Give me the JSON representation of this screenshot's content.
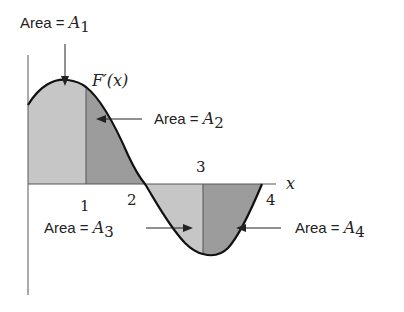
{
  "diagram": {
    "curve_label": "F′(x)",
    "axis_label_x": "x",
    "ticks": [
      "1",
      "2",
      "3",
      "4"
    ],
    "areas": [
      {
        "id": "A1",
        "prefix": "Area = ",
        "symbol": "A",
        "sub": "1"
      },
      {
        "id": "A2",
        "prefix": "Area = ",
        "symbol": "A",
        "sub": "2"
      },
      {
        "id": "A3",
        "prefix": "Area = ",
        "symbol": "A",
        "sub": "3"
      },
      {
        "id": "A4",
        "prefix": "Area = ",
        "symbol": "A",
        "sub": "4"
      }
    ],
    "colors": {
      "region_light": "#c4c4c4",
      "region_dark": "#9a9a9a",
      "curve": "#111111",
      "axis": "#555555"
    }
  }
}
